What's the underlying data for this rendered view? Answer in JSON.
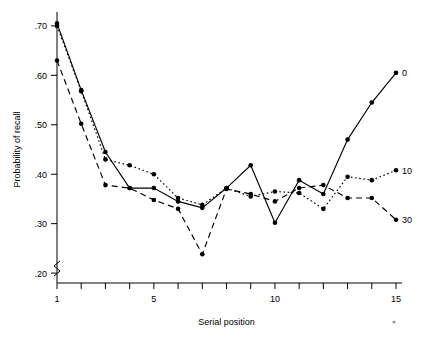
{
  "chart_data": {
    "type": "line",
    "title": "",
    "xlabel": "Serial position",
    "ylabel": "Probability of recall",
    "x": [
      1,
      2,
      3,
      4,
      5,
      6,
      7,
      8,
      9,
      10,
      11,
      12,
      13,
      14,
      15
    ],
    "xlim": [
      1,
      15
    ],
    "ylim": [
      0.18,
      0.72
    ],
    "xticks": [
      1,
      2,
      3,
      4,
      5,
      6,
      7,
      8,
      9,
      10,
      11,
      12,
      13,
      14,
      15
    ],
    "xtick_labels": {
      "1": "1",
      "5": "5",
      "10": "10",
      "15": "15"
    },
    "yticks": [
      0.2,
      0.3,
      0.4,
      0.5,
      0.6,
      0.7
    ],
    "ytick_labels": [
      ".20",
      ".30",
      ".40",
      ".50",
      ".60",
      ".70"
    ],
    "grid": false,
    "y_axis_break": true,
    "legend_position": "right-of-last-point",
    "series": [
      {
        "name": "0",
        "label": "0",
        "linestyle": "solid",
        "marker": "filled-circle",
        "values": [
          0.705,
          0.57,
          0.445,
          0.372,
          0.372,
          0.345,
          0.332,
          0.372,
          0.418,
          0.302,
          0.388,
          0.36,
          0.47,
          0.545,
          0.605
        ]
      },
      {
        "name": "10",
        "label": "10",
        "linestyle": "dotted",
        "marker": "filled-circle",
        "values": [
          0.7,
          0.568,
          0.43,
          0.418,
          0.4,
          0.352,
          0.338,
          0.372,
          0.355,
          0.365,
          0.362,
          0.33,
          0.395,
          0.388,
          0.408
        ]
      },
      {
        "name": "30",
        "label": "30",
        "linestyle": "dashed",
        "marker": "filled-circle",
        "values": [
          0.63,
          0.502,
          0.378,
          0.372,
          0.348,
          0.33,
          0.238,
          0.37,
          0.36,
          0.345,
          0.372,
          0.378,
          0.352,
          0.352,
          0.308
        ]
      }
    ],
    "annotations": [
      {
        "name": "stray-mark",
        "text": "",
        "x": 15.0,
        "y_px": 322
      }
    ]
  }
}
